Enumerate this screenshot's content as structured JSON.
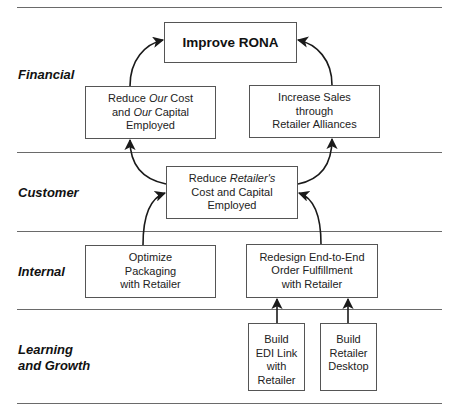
{
  "caption": "Figure 2-8  Sample Balanced Scorecard Map",
  "perspectives": [
    {
      "id": "financial",
      "label": "Financial"
    },
    {
      "id": "customer",
      "label": "Customer"
    },
    {
      "id": "internal",
      "label": "Internal"
    },
    {
      "id": "learning",
      "label_lines": [
        "Learning",
        "and Growth"
      ]
    }
  ],
  "objectives": {
    "improve_rona": {
      "lines": [
        "Improve RONA"
      ]
    },
    "reduce_our_cost": {
      "lines": [
        "Reduce |Our| Cost",
        "and |Our| Capital",
        "Employed"
      ],
      "line0": {
        "a": "Reduce ",
        "em": "Our",
        "b": " Cost"
      },
      "line1": {
        "a": "and ",
        "em": "Our",
        "b": " Capital"
      },
      "line2": "Employed"
    },
    "increase_sales": {
      "lines": [
        "Increase Sales",
        "through",
        "Retailer Alliances"
      ]
    },
    "reduce_retailer_cost": {
      "line0": {
        "a": "Reduce ",
        "em": "Retailer's"
      },
      "line1": "Cost and Capital",
      "line2": "Employed"
    },
    "optimize_packaging": {
      "lines": [
        "Optimize",
        "Packaging",
        "with Retailer"
      ]
    },
    "redesign_fulfillment": {
      "lines": [
        "Redesign End-to-End",
        "Order Fulfillment",
        "with Retailer"
      ]
    },
    "build_edi": {
      "lines": [
        "Build",
        "EDI Link",
        "with",
        "Retailer"
      ]
    },
    "build_desktop": {
      "lines": [
        "Build",
        "Retailer",
        "Desktop"
      ]
    }
  },
  "colors": {
    "line": "#6a6a6a",
    "box_border": "#555555",
    "arrow": "#1a1a1a",
    "text": "#222222"
  }
}
